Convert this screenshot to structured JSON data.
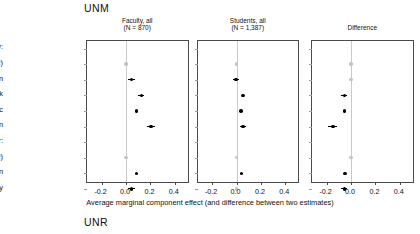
{
  "figure": {
    "group_top_label": "UNM",
    "group_bottom_label": "UNR",
    "axis_caption": "Average marginal component effect (and difference between two estimates)"
  },
  "rows": [
    {
      "label": "Race/ethnicity:",
      "type": "header"
    },
    {
      "label": "White (baseline)",
      "type": "item"
    },
    {
      "label": "Asian",
      "type": "item"
    },
    {
      "label": "Black",
      "type": "item"
    },
    {
      "label": "Hispanic",
      "type": "item"
    },
    {
      "label": "Native American",
      "type": "item"
    },
    {
      "label": "Gender:",
      "type": "header"
    },
    {
      "label": "Man (baseline)",
      "type": "item"
    },
    {
      "label": "Woman",
      "type": "item"
    },
    {
      "label": "Nonbinary",
      "type": "item"
    }
  ],
  "axis": {
    "ticks": [
      "-0.2",
      "0.0",
      "0.2",
      "0.4"
    ],
    "tick_values": [
      -0.2,
      0.0,
      0.2,
      0.4
    ],
    "xmin": -0.32,
    "xmax": 0.52
  },
  "panels": [
    {
      "title_line1": "Faculty, all",
      "title_line2": "(N = 870)"
    },
    {
      "title_line1": "Students, all",
      "title_line2": "(N = 1,387)"
    },
    {
      "title_line1": "Difference",
      "title_line2": ""
    }
  ],
  "chart_data": {
    "type": "scatter",
    "title": "UNM",
    "xlabel": "Average marginal component effect (and difference between two estimates)",
    "ylabel": "",
    "xlim": [
      -0.32,
      0.52
    ],
    "xticks": [
      -0.2,
      0.0,
      0.2,
      0.4
    ],
    "grid": false,
    "legend": "none",
    "categories": [
      "Race/ethnicity:",
      "White (baseline)",
      "Asian",
      "Black",
      "Hispanic",
      "Native American",
      "Gender:",
      "Man (baseline)",
      "Woman",
      "Nonbinary"
    ],
    "series": [
      {
        "name": "Faculty, all (N = 870)",
        "points": [
          {
            "category": "White (baseline)",
            "value": 0.0,
            "ci_low": 0.0,
            "ci_high": 0.0,
            "reference": true
          },
          {
            "category": "Asian",
            "value": 0.045,
            "ci_low": 0.02,
            "ci_high": 0.07,
            "reference": false
          },
          {
            "category": "Black",
            "value": 0.125,
            "ci_low": 0.1,
            "ci_high": 0.15,
            "reference": false
          },
          {
            "category": "Hispanic",
            "value": 0.085,
            "ci_low": 0.075,
            "ci_high": 0.095,
            "reference": false
          },
          {
            "category": "Native American",
            "value": 0.205,
            "ci_low": 0.175,
            "ci_high": 0.235,
            "reference": false
          },
          {
            "category": "Man (baseline)",
            "value": 0.0,
            "ci_low": 0.0,
            "ci_high": 0.0,
            "reference": true
          },
          {
            "category": "Woman",
            "value": 0.085,
            "ci_low": 0.075,
            "ci_high": 0.095,
            "reference": false
          },
          {
            "category": "Nonbinary",
            "value": 0.045,
            "ci_low": 0.02,
            "ci_high": 0.07,
            "reference": false
          }
        ]
      },
      {
        "name": "Students, all (N = 1,387)",
        "points": [
          {
            "category": "White (baseline)",
            "value": 0.0,
            "ci_low": 0.0,
            "ci_high": 0.0,
            "reference": true
          },
          {
            "category": "Asian",
            "value": -0.005,
            "ci_low": -0.03,
            "ci_high": 0.02,
            "reference": false
          },
          {
            "category": "Black",
            "value": 0.055,
            "ci_low": 0.045,
            "ci_high": 0.065,
            "reference": false
          },
          {
            "category": "Hispanic",
            "value": 0.035,
            "ci_low": 0.025,
            "ci_high": 0.045,
            "reference": false
          },
          {
            "category": "Native American",
            "value": 0.055,
            "ci_low": 0.03,
            "ci_high": 0.08,
            "reference": false
          },
          {
            "category": "Man (baseline)",
            "value": 0.0,
            "ci_low": 0.0,
            "ci_high": 0.0,
            "reference": true
          },
          {
            "category": "Woman",
            "value": 0.04,
            "ci_low": 0.03,
            "ci_high": 0.05,
            "reference": false
          },
          {
            "category": "Nonbinary",
            "value": 0.0,
            "ci_low": -0.005,
            "ci_high": 0.005,
            "reference": true
          }
        ]
      },
      {
        "name": "Difference",
        "points": [
          {
            "category": "White (baseline)",
            "value": 0.0,
            "ci_low": 0.0,
            "ci_high": 0.0,
            "reference": true
          },
          {
            "category": "Asian",
            "value": 0.0,
            "ci_low": -0.01,
            "ci_high": 0.01,
            "reference": true
          },
          {
            "category": "Black",
            "value": -0.055,
            "ci_low": -0.08,
            "ci_high": -0.03,
            "reference": false
          },
          {
            "category": "Hispanic",
            "value": -0.055,
            "ci_low": -0.07,
            "ci_high": -0.04,
            "reference": false
          },
          {
            "category": "Native American",
            "value": -0.15,
            "ci_low": -0.185,
            "ci_high": -0.115,
            "reference": false
          },
          {
            "category": "Man (baseline)",
            "value": 0.0,
            "ci_low": 0.0,
            "ci_high": 0.0,
            "reference": true
          },
          {
            "category": "Woman",
            "value": -0.05,
            "ci_low": -0.06,
            "ci_high": -0.04,
            "reference": false
          },
          {
            "category": "Nonbinary",
            "value": -0.055,
            "ci_low": -0.08,
            "ci_high": -0.03,
            "reference": false
          }
        ]
      }
    ]
  }
}
